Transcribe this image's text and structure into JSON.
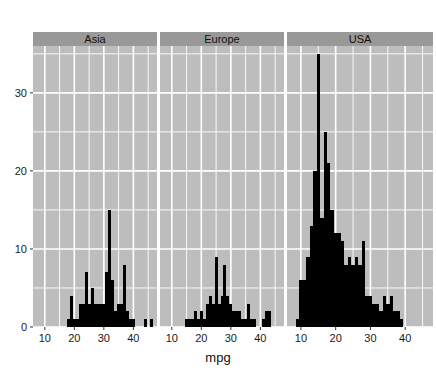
{
  "figure": {
    "width": 436,
    "height": 380,
    "background": "#ffffff",
    "panel_background": "#bdbdbd",
    "grid_color": "#ffffff",
    "strip_background": "#999999",
    "bar_color": "#000000",
    "tick_color": "#333333",
    "text_color": "#111111"
  },
  "chart_data": {
    "type": "bar",
    "chart_subtype": "histogram-facet",
    "title": "",
    "xlabel": "mpg",
    "ylabel": "",
    "grid": true,
    "legend_position": "none",
    "facet_variable": "country",
    "facets": [
      "Asia",
      "Europe",
      "USA"
    ],
    "xlim": [
      6,
      48
    ],
    "ylim": [
      0,
      36
    ],
    "xticks": [
      10,
      20,
      30,
      40
    ],
    "yticks": [
      0,
      10,
      20,
      30
    ],
    "xtick_labels": [
      "10",
      "20",
      "30",
      "40"
    ],
    "ytick_labels": [
      "0",
      "10",
      "20",
      "30"
    ],
    "bin_width": 1,
    "panels": [
      {
        "name": "Asia",
        "x": [
          18,
          19,
          20,
          21,
          22,
          23,
          24,
          25,
          26,
          27,
          28,
          29,
          30,
          31,
          32,
          33,
          34,
          35,
          36,
          37,
          38,
          39,
          40,
          41,
          44,
          46
        ],
        "values": [
          1,
          4,
          1,
          1,
          3,
          3,
          7,
          3,
          5,
          3,
          3,
          3,
          3,
          7,
          15,
          6,
          2,
          3,
          3,
          8,
          2,
          1,
          1,
          0,
          1,
          1
        ]
      },
      {
        "name": "Europe",
        "x": [
          15,
          16,
          17,
          18,
          19,
          20,
          21,
          22,
          23,
          24,
          25,
          26,
          27,
          28,
          29,
          30,
          31,
          32,
          33,
          34,
          35,
          36,
          37,
          38,
          41,
          42,
          43
        ],
        "values": [
          1,
          1,
          1,
          2,
          1,
          2,
          1,
          3,
          4,
          3,
          9,
          3,
          4,
          8,
          4,
          3,
          2,
          2,
          2,
          1,
          1,
          3,
          1,
          1,
          1,
          2,
          2
        ]
      },
      {
        "name": "USA",
        "x": [
          9,
          10,
          11,
          12,
          13,
          14,
          15,
          16,
          17,
          18,
          19,
          20,
          21,
          22,
          23,
          24,
          25,
          26,
          27,
          28,
          29,
          30,
          31,
          32,
          33,
          34,
          35,
          36,
          37,
          38,
          39
        ],
        "values": [
          1,
          6,
          6,
          9,
          13,
          20,
          35,
          14,
          25,
          21,
          15,
          12,
          12,
          11,
          8,
          9,
          8,
          9,
          8,
          11,
          4,
          4,
          3,
          3,
          2,
          4,
          3,
          4,
          2,
          2,
          1
        ]
      }
    ]
  },
  "axis": {
    "x_title": "mpg",
    "y_title": ""
  },
  "strips": [
    {
      "label": "Asia"
    },
    {
      "label": "Europe"
    },
    {
      "label": "USA"
    }
  ]
}
